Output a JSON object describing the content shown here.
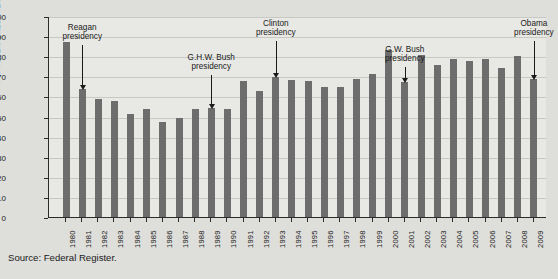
{
  "source_note": "Source: Federal Register.",
  "colors": {
    "bar": "#6d6d6d",
    "page_background": "#dededa",
    "plot_background": "#e8e8e4",
    "axis": "#2b2b2b",
    "gridline": "#c9c9c4",
    "text": "#1a1a1a"
  },
  "chart_data": {
    "type": "bar",
    "title": "",
    "xlabel": "",
    "ylabel": "# OF FEDERAL REGISTER PAGES (in 1000s)",
    "ylim": [
      0,
      100
    ],
    "yticks": [
      0,
      10,
      20,
      30,
      40,
      50,
      60,
      70,
      80,
      90,
      100
    ],
    "grid": true,
    "legend": "none",
    "categories": [
      "1980",
      "1981",
      "1982",
      "1983",
      "1984",
      "1985",
      "1986",
      "1987",
      "1988",
      "1989",
      "1990",
      "1991",
      "1992",
      "1993",
      "1994",
      "1995",
      "1996",
      "1997",
      "1998",
      "1999",
      "2000",
      "2001",
      "2002",
      "2003",
      "2004",
      "2005",
      "2006",
      "2007",
      "2008",
      "2009"
    ],
    "values": [
      87,
      63.5,
      58.5,
      57.5,
      51.5,
      53.5,
      47.5,
      49.5,
      53.5,
      54,
      53.5,
      67.5,
      62.5,
      69.5,
      68,
      67.5,
      64.5,
      64.5,
      68.5,
      71,
      83,
      67,
      80.5,
      75.5,
      78.5,
      77.5,
      78.5,
      74,
      80,
      68.5
    ],
    "annotations": [
      {
        "label_line1": "Reagan",
        "label_line2": "presidency",
        "points_to_category": "1981"
      },
      {
        "label_line1": "G.H.W. Bush",
        "label_line2": "presidency",
        "points_to_category": "1989"
      },
      {
        "label_line1": "Clinton",
        "label_line2": "presidency",
        "points_to_category": "1993"
      },
      {
        "label_line1": "G.W. Bush",
        "label_line2": "presidency",
        "points_to_category": "2001"
      },
      {
        "label_line1": "Obama",
        "label_line2": "presidency",
        "points_to_category": "2009"
      }
    ]
  }
}
